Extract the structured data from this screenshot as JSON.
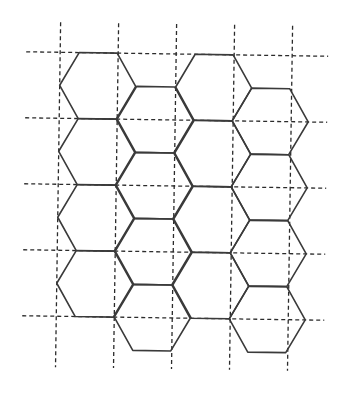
{
  "diagram": {
    "title": "",
    "colors": {
      "background": "#ffffff",
      "hex_stroke": "#3a3a3a",
      "grid_stroke": "#2b2b2b"
    },
    "tilt_degrees": 0.85,
    "grid": {
      "vertical_lines_x": [
        58,
        116,
        174,
        232,
        290
      ],
      "vertical_extent_y": [
        24,
        369
      ],
      "horizontal_lines_y": [
        54,
        120,
        186,
        252,
        318
      ],
      "horizontal_extent_x": [
        24,
        326
      ]
    },
    "hexagon": {
      "radius": 38,
      "half_edge": 19,
      "half_height": 33
    },
    "columns": [
      {
        "id": "A",
        "cx": 96,
        "centers_y": [
          87,
          153,
          219,
          285
        ]
      },
      {
        "id": "B",
        "cx": 154,
        "centers_y": [
          120,
          186,
          252,
          318
        ]
      },
      {
        "id": "C",
        "cx": 212,
        "centers_y": [
          87,
          153,
          219,
          285
        ]
      },
      {
        "id": "D",
        "cx": 269,
        "centers_y": [
          120,
          186,
          252,
          318
        ]
      }
    ]
  }
}
